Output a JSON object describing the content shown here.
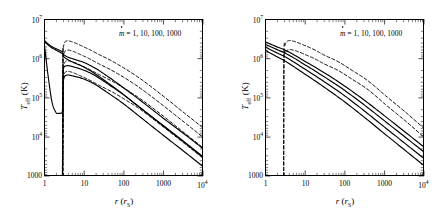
{
  "figure": {
    "panels": [
      {
        "id": "left",
        "annotation": "= 1, 10, 100, 1000",
        "annotation_symbol": "m",
        "xlabel_main": "r",
        "xlabel_paren_open": " (",
        "xlabel_sub": "r",
        "xlabel_subsub": "S",
        "xlabel_paren_close": ")",
        "ylabel_main": "T",
        "ylabel_sub": "eff",
        "ylabel_unit": " (K)",
        "xticks": [
          "1",
          "10",
          "100",
          "1000",
          "10"
        ],
        "xtick_last_exp": "4",
        "yticks": [
          "10",
          "10",
          "10",
          "10",
          "1000"
        ],
        "ytick_exps": [
          "7",
          "6",
          "5",
          "4",
          ""
        ]
      },
      {
        "id": "right",
        "annotation": "= 1, 10, 100, 1000",
        "annotation_symbol": "m",
        "xlabel_main": "r",
        "xlabel_paren_open": " (",
        "xlabel_sub": "r",
        "xlabel_subsub": "S",
        "xlabel_paren_close": ")",
        "ylabel_main": "T",
        "ylabel_sub": "eff",
        "ylabel_unit": " (K)",
        "xticks": [
          "1",
          "10",
          "100",
          "1000",
          "10"
        ],
        "xtick_last_exp": "4",
        "yticks": [
          "10",
          "10",
          "10",
          "10",
          "1000"
        ],
        "ytick_exps": [
          "7",
          "6",
          "5",
          "4",
          ""
        ]
      }
    ]
  },
  "chart_data": [
    {
      "type": "line",
      "panel": "left",
      "title": "",
      "xlabel": "r (r_S)",
      "ylabel": "T_eff (K)",
      "xscale": "log",
      "yscale": "log",
      "xlim": [
        1,
        10000
      ],
      "ylim": [
        1000,
        10000000
      ],
      "xticks": [
        1,
        10,
        100,
        1000,
        10000
      ],
      "yticks": [
        1000,
        10000,
        100000,
        1000000,
        10000000
      ],
      "grid": false,
      "legend": "m-dot = 1, 10, 100, 1000",
      "annotation": "ṁ = 1, 10, 100, 1000",
      "series": [
        {
          "name": "mdot=1000 solid",
          "style": "solid",
          "x": [
            1.0,
            1.2,
            1.5,
            2.0,
            2.4,
            2.7,
            2.9,
            2.98,
            3.0,
            3.05,
            3.2,
            3.6,
            4.3,
            5.5,
            7.0,
            10,
            20,
            50,
            100,
            300,
            1000,
            3000,
            10000
          ],
          "y": [
            3000000,
            2500000,
            2100000,
            1800000,
            1650000,
            1550000,
            1500000,
            1450000,
            1400000,
            1350000,
            1250000,
            1150000,
            1060000,
            980000,
            900000,
            800000,
            560000,
            300000,
            180000,
            78000,
            30000,
            13000,
            5000
          ]
        },
        {
          "name": "mdot=100 solid",
          "style": "solid",
          "x": [
            1.0,
            1.2,
            1.5,
            2.0,
            2.4,
            2.7,
            2.9,
            2.98,
            3.0,
            3.05,
            3.2,
            3.6,
            4.3,
            5.5,
            7.0,
            10,
            20,
            50,
            100,
            300,
            1000,
            3000,
            10000
          ],
          "y": [
            2800000,
            2350000,
            1950000,
            1650000,
            1500000,
            1400000,
            1340000,
            1300000,
            1250000,
            1200000,
            1100000,
            1000000,
            900000,
            800000,
            720000,
            610000,
            400000,
            205000,
            120000,
            50000,
            19000,
            8000,
            3000
          ]
        },
        {
          "name": "mdot=10 solid with dip",
          "style": "solid",
          "x": [
            1.0,
            1.1,
            1.3,
            1.6,
            2.0,
            2.3,
            2.6,
            2.8,
            2.9,
            2.95,
            3.0,
            3.05,
            3.1,
            3.3,
            3.8,
            4.5,
            6,
            8,
            12,
            20,
            50,
            100,
            300,
            1000,
            3000,
            10000
          ],
          "y": [
            2700000,
            1200000,
            300000,
            75000,
            42000,
            40000,
            40000,
            41000,
            45000,
            70000,
            250000,
            450000,
            560000,
            630000,
            660000,
            650000,
            600000,
            550000,
            470000,
            360000,
            195000,
            120000,
            50000,
            19500,
            8200,
            3100
          ]
        },
        {
          "name": "mdot=1 solid lower",
          "style": "solid",
          "x": [
            2.9,
            3.0,
            3.05,
            3.1,
            3.3,
            3.8,
            4.5,
            6,
            8,
            12,
            20,
            50,
            100,
            300,
            1000,
            3000,
            10000
          ],
          "y": [
            1000,
            30000,
            180000,
            280000,
            350000,
            380000,
            375000,
            350000,
            325000,
            280000,
            215000,
            115000,
            70000,
            29000,
            11000,
            4600,
            1750
          ]
        },
        {
          "name": "mdot=1000 dashed",
          "style": "dashed",
          "x": [
            2.95,
            3.0,
            3.1,
            3.4,
            4.0,
            5.0,
            6.5,
            9,
            14,
            25,
            50,
            120,
            300,
            1000,
            3000,
            10000
          ],
          "y": [
            1000,
            900000,
            2000000,
            2700000,
            2850000,
            2700000,
            2450000,
            2100000,
            1700000,
            1250000,
            880000,
            520000,
            280000,
            110000,
            45000,
            17000
          ]
        },
        {
          "name": "mdot=100 dashed",
          "style": "dashed",
          "x": [
            2.95,
            3.0,
            3.1,
            3.4,
            4.0,
            5.0,
            6.5,
            9,
            14,
            25,
            50,
            120,
            300,
            1000,
            3000,
            10000
          ],
          "y": [
            1000,
            550000,
            1150000,
            1550000,
            1650000,
            1580000,
            1420000,
            1220000,
            990000,
            720000,
            505000,
            300000,
            160000,
            63000,
            26000,
            9800
          ]
        },
        {
          "name": "mdot=10 dashed",
          "style": "dashed",
          "x": [
            2.95,
            3.0,
            3.1,
            3.4,
            4.0,
            5.0,
            6.5,
            9,
            14,
            25,
            50,
            120,
            300,
            1000,
            3000,
            10000
          ],
          "y": [
            1000,
            300000,
            620000,
            830000,
            880000,
            840000,
            760000,
            650000,
            530000,
            385000,
            270000,
            160000,
            86000,
            34000,
            14000,
            5300
          ]
        },
        {
          "name": "mdot=1 dashed",
          "style": "dashed",
          "x": [
            2.95,
            3.0,
            3.1,
            3.4,
            4.0,
            5.0,
            6.5,
            9,
            14,
            25,
            50,
            120,
            300,
            1000,
            3000,
            10000
          ],
          "y": [
            1000,
            150000,
            330000,
            445000,
            470000,
            450000,
            405000,
            348000,
            283000,
            206000,
            144000,
            85000,
            46000,
            18000,
            7500,
            2850
          ]
        },
        {
          "name": "vertical cutoff dashed",
          "style": "dashed-vertical",
          "x": [
            3.0,
            3.0
          ],
          "y": [
            1000,
            2000000
          ]
        }
      ]
    },
    {
      "type": "line",
      "panel": "right",
      "title": "",
      "xlabel": "r (r_S)",
      "ylabel": "T_eff (K)",
      "xscale": "log",
      "yscale": "log",
      "xlim": [
        1,
        10000
      ],
      "ylim": [
        1000,
        10000000
      ],
      "xticks": [
        1,
        10,
        100,
        1000,
        10000
      ],
      "yticks": [
        1000,
        10000,
        100000,
        1000000,
        10000000
      ],
      "grid": false,
      "legend": "m-dot = 1, 10, 100, 1000",
      "annotation": "ṁ = 1, 10, 100, 1000",
      "series": [
        {
          "name": "mdot=1000 solid",
          "style": "solid",
          "x": [
            1,
            2,
            3,
            5,
            10,
            20,
            50,
            100,
            300,
            1000,
            3000,
            10000
          ],
          "y": [
            2700000,
            2000000,
            1700000,
            1300000,
            860000,
            570000,
            320000,
            200000,
            90000,
            35000,
            14500,
            5500
          ]
        },
        {
          "name": "mdot=100 solid",
          "style": "solid",
          "x": [
            1,
            2,
            3,
            5,
            10,
            20,
            50,
            100,
            300,
            1000,
            3000,
            10000
          ],
          "y": [
            2350000,
            1700000,
            1430000,
            1080000,
            700000,
            455000,
            250000,
            155000,
            68000,
            26000,
            10800,
            4100
          ]
        },
        {
          "name": "mdot=10 solid",
          "style": "solid",
          "x": [
            1,
            2,
            3,
            5,
            10,
            20,
            50,
            100,
            300,
            1000,
            3000,
            10000
          ],
          "y": [
            2000000,
            1400000,
            1150000,
            850000,
            540000,
            345000,
            185000,
            113000,
            48000,
            18000,
            7400,
            2800
          ]
        },
        {
          "name": "mdot=1 solid",
          "style": "solid",
          "x": [
            1,
            2,
            3,
            5,
            10,
            20,
            50,
            100,
            300,
            1000,
            3000,
            10000
          ],
          "y": [
            1650000,
            1120000,
            900000,
            650000,
            405000,
            253000,
            132000,
            79000,
            33000,
            12200,
            4950,
            1850
          ]
        },
        {
          "name": "mdot=1000 dashed",
          "style": "dashed",
          "x": [
            2.95,
            3.0,
            3.2,
            3.6,
            4.3,
            5.5,
            7.5,
            11,
            18,
            32,
            70,
            160,
            400,
            1200,
            3500,
            10000
          ],
          "y": [
            1000,
            1200000,
            2200000,
            2750000,
            2900000,
            2750000,
            2450000,
            2080000,
            1660000,
            1210000,
            830000,
            490000,
            265000,
            103000,
            42000,
            16500
          ]
        },
        {
          "name": "mdot=100 dashed",
          "style": "dashed",
          "x": [
            2.95,
            3.0,
            3.2,
            3.6,
            4.3,
            5.5,
            7.5,
            11,
            18,
            32,
            70,
            160,
            400,
            1200,
            3500,
            10000
          ],
          "y": [
            1000,
            800000,
            1350000,
            1620000,
            1700000,
            1620000,
            1450000,
            1230000,
            985000,
            720000,
            495000,
            292000,
            158000,
            61000,
            25000,
            9800
          ]
        }
      ]
    }
  ]
}
